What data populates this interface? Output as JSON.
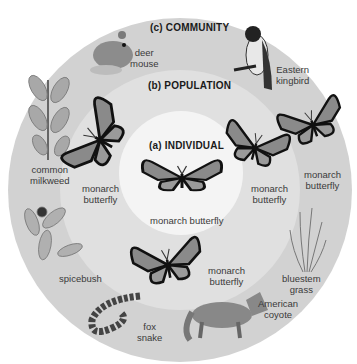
{
  "levels": {
    "individual": {
      "heading": "(a) INDIVIDUAL",
      "organism": "monarch butterfly"
    },
    "population": {
      "heading": "(b) POPULATION",
      "organisms": [
        {
          "line1": "monarch",
          "line2": "butterfly"
        },
        {
          "line1": "monarch",
          "line2": "butterfly"
        },
        {
          "line1": "monarch",
          "line2": "butterfly"
        },
        {
          "line1": "monarch",
          "line2": "butterfly"
        }
      ]
    },
    "community": {
      "heading": "(c) COMMUNITY",
      "organisms": [
        {
          "line1": "deer",
          "line2": "mouse"
        },
        {
          "line1": "Eastern",
          "line2": "kingbird"
        },
        {
          "line1": "common",
          "line2": "milkweed"
        },
        {
          "line1": "spicebush",
          "line2": ""
        },
        {
          "line1": "fox",
          "line2": "snake"
        },
        {
          "line1": "American",
          "line2": "coyote"
        },
        {
          "line1": "bluestem",
          "line2": "grass"
        }
      ]
    }
  },
  "colors": {
    "outer_ring": "#d2d2d2",
    "middle_ring": "#e0e0e0",
    "inner_circle": "#f4f4f4",
    "text": "#3a3a3a"
  }
}
